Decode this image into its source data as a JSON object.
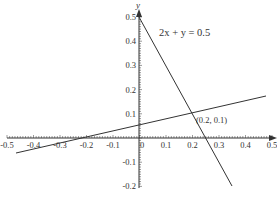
{
  "chart_data": {
    "type": "line",
    "title": "",
    "xlabel": "x",
    "ylabel": "y",
    "xlim": [
      -0.5,
      0.5
    ],
    "ylim": [
      -0.2,
      0.5
    ],
    "grid": false,
    "legend": null,
    "x_ticks": [
      "-0.5",
      "-0.4",
      "-0.3",
      "-0.2",
      "-0.1",
      "0",
      "0.1",
      "0.2",
      "0.3",
      "0.4",
      "0.5"
    ],
    "y_ticks": [
      "0.5",
      "0.4",
      "0.3",
      "0.2",
      "0.1",
      "-0.1",
      "-0.2"
    ],
    "series": [
      {
        "name": "2x + y = 0.5",
        "equation": "y = 0.5 - 2x",
        "x": [
          0,
          0.35
        ],
        "y": [
          0.5,
          -0.2
        ]
      },
      {
        "name": "line through (-0.2, 0) and (0.2, 0.1)",
        "equation": "y = 0.25x + 0.05",
        "x": [
          -0.45,
          0.48
        ],
        "y": [
          -0.0625,
          0.17
        ]
      }
    ],
    "annotations": [
      {
        "text": "2x + y = 0.5",
        "x": 0.05,
        "y": 0.44
      },
      {
        "text": "(0.2, 0.1)",
        "x": 0.2,
        "y": 0.1,
        "marker": "intersection"
      }
    ]
  },
  "labels": {
    "x_axis": "x",
    "y_axis": "y",
    "equation": "2x + y = 0.5",
    "intersection": "(0.2, 0.1)",
    "x_ticks": [
      "-0.5",
      "-0.4",
      "-0.3",
      "-0.2",
      "-0.1",
      "0",
      "0.1",
      "0.2",
      "0.3",
      "0.4",
      "0.5"
    ],
    "y_ticks": [
      "0.5",
      "0.4",
      "0.3",
      "0.2",
      "0.1",
      "-0.1",
      "-0.2"
    ]
  },
  "colors": {
    "axis": "#333333",
    "line": "#333333",
    "background": "#ffffff"
  }
}
